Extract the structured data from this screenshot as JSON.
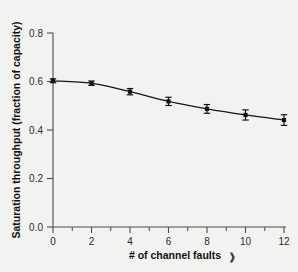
{
  "chart_data": {
    "type": "line",
    "title": "",
    "xlabel": "# of channel faults",
    "ylabel": "Saturation throughput (fraction of capacity)",
    "x": [
      0,
      2,
      4,
      6,
      8,
      10,
      12
    ],
    "values": [
      0.603,
      0.593,
      0.558,
      0.518,
      0.487,
      0.462,
      0.441
    ],
    "errors": [
      0.008,
      0.009,
      0.013,
      0.017,
      0.018,
      0.021,
      0.022
    ],
    "xlim": [
      0,
      12
    ],
    "ylim": [
      0.0,
      0.8
    ],
    "xticks": [
      "0",
      "2",
      "4",
      "6",
      "8",
      "10",
      "12"
    ],
    "xtick_values": [
      0,
      2,
      4,
      6,
      8,
      10,
      12
    ],
    "xminor_values": [
      1,
      3,
      5,
      7,
      9,
      11
    ],
    "yticks": [
      "0.0",
      "0.2",
      "0.4",
      "0.6",
      "0.8"
    ],
    "ytick_values": [
      0.0,
      0.2,
      0.4,
      0.6,
      0.8
    ],
    "grid": false,
    "legend": null,
    "marker": "square",
    "series_color": "#151515",
    "background_color": "#f2f2f0",
    "axis_color": "#4a4a4a"
  },
  "annotations": {
    "stray_mark": "❱"
  }
}
